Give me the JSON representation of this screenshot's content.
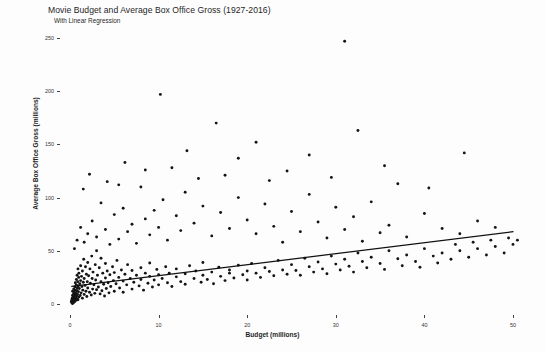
{
  "chart_data": {
    "type": "scatter",
    "title": "Movie Budget and Average Box Office Gross (1927-2016)",
    "subtitle": "With Linear Regression",
    "xlabel": "Budget (millions)",
    "ylabel": "Average Box Office Gross (millions)",
    "xlim": [
      -1.0,
      52.0
    ],
    "ylim": [
      -12.0,
      262.0
    ],
    "xticks": [
      0,
      10,
      20,
      30,
      40,
      50
    ],
    "xtick_labels": [
      "0",
      "10",
      "20",
      "30",
      "40",
      "50"
    ],
    "yticks": [
      0,
      50,
      100,
      150,
      200,
      250
    ],
    "ytick_labels": [
      "0",
      "50",
      "100",
      "150",
      "200",
      "250"
    ],
    "grid": false,
    "legend": "none",
    "marker_color": "#141414",
    "line_color": "#111111",
    "background_color": "#fdfdfd",
    "regression": {
      "name": "Linear Regression",
      "x_start": 0.2,
      "y_start": 16.5,
      "x_end": 50.0,
      "y_end": 68.0,
      "slope": 1.035,
      "intercept": 16.3
    },
    "points": [
      [
        0.15,
        2.0
      ],
      [
        0.2,
        3.5
      ],
      [
        0.22,
        1.0
      ],
      [
        0.25,
        5.5
      ],
      [
        0.28,
        8.0
      ],
      [
        0.3,
        0.5
      ],
      [
        0.3,
        12.0
      ],
      [
        0.32,
        4.0
      ],
      [
        0.35,
        2.5
      ],
      [
        0.38,
        6.5
      ],
      [
        0.4,
        9.5
      ],
      [
        0.4,
        1.5
      ],
      [
        0.42,
        14.0
      ],
      [
        0.45,
        3.0
      ],
      [
        0.48,
        7.0
      ],
      [
        0.5,
        11.0
      ],
      [
        0.5,
        5.0
      ],
      [
        0.52,
        2.0
      ],
      [
        0.55,
        16.0
      ],
      [
        0.58,
        8.5
      ],
      [
        0.6,
        4.5
      ],
      [
        0.6,
        20.0
      ],
      [
        0.62,
        13.0
      ],
      [
        0.65,
        6.0
      ],
      [
        0.68,
        10.0
      ],
      [
        0.7,
        3.5
      ],
      [
        0.7,
        18.0
      ],
      [
        0.72,
        23.0
      ],
      [
        0.75,
        7.5
      ],
      [
        0.78,
        12.5
      ],
      [
        0.8,
        5.0
      ],
      [
        0.8,
        27.0
      ],
      [
        0.82,
        15.0
      ],
      [
        0.85,
        9.0
      ],
      [
        0.88,
        21.0
      ],
      [
        0.9,
        4.0
      ],
      [
        0.9,
        33.0
      ],
      [
        0.92,
        17.0
      ],
      [
        0.95,
        11.5
      ],
      [
        0.98,
        25.0
      ],
      [
        1.0,
        6.5
      ],
      [
        1.0,
        29.0
      ],
      [
        1.05,
        14.5
      ],
      [
        1.1,
        19.0
      ],
      [
        1.15,
        8.0
      ],
      [
        1.2,
        36.0
      ],
      [
        1.2,
        22.0
      ],
      [
        1.25,
        10.5
      ],
      [
        1.3,
        26.0
      ],
      [
        1.35,
        16.5
      ],
      [
        1.4,
        5.5
      ],
      [
        1.4,
        31.0
      ],
      [
        1.45,
        13.0
      ],
      [
        1.5,
        20.5
      ],
      [
        1.55,
        42.0
      ],
      [
        1.6,
        9.0
      ],
      [
        1.6,
        24.0
      ],
      [
        1.7,
        17.5
      ],
      [
        1.75,
        35.0
      ],
      [
        1.8,
        12.0
      ],
      [
        1.85,
        28.0
      ],
      [
        1.9,
        7.0
      ],
      [
        1.95,
        21.0
      ],
      [
        2.0,
        39.0
      ],
      [
        2.0,
        15.0
      ],
      [
        2.1,
        26.5
      ],
      [
        2.2,
        11.0
      ],
      [
        2.25,
        33.0
      ],
      [
        2.3,
        19.5
      ],
      [
        2.4,
        8.5
      ],
      [
        2.45,
        45.0
      ],
      [
        2.5,
        24.0
      ],
      [
        2.55,
        14.0
      ],
      [
        2.6,
        30.0
      ],
      [
        2.7,
        18.0
      ],
      [
        2.8,
        10.0
      ],
      [
        2.85,
        37.0
      ],
      [
        2.9,
        22.5
      ],
      [
        3.0,
        13.5
      ],
      [
        3.0,
        50.0
      ],
      [
        3.1,
        27.0
      ],
      [
        3.2,
        16.0
      ],
      [
        3.3,
        34.0
      ],
      [
        3.4,
        9.5
      ],
      [
        3.5,
        21.0
      ],
      [
        3.5,
        43.0
      ],
      [
        3.6,
        12.5
      ],
      [
        3.7,
        29.0
      ],
      [
        3.8,
        18.5
      ],
      [
        3.9,
        7.5
      ],
      [
        4.0,
        24.5
      ],
      [
        4.0,
        38.0
      ],
      [
        4.1,
        14.5
      ],
      [
        4.2,
        31.0
      ],
      [
        4.3,
        20.0
      ],
      [
        4.4,
        10.5
      ],
      [
        4.5,
        27.5
      ],
      [
        4.6,
        16.5
      ],
      [
        4.8,
        35.0
      ],
      [
        4.9,
        22.0
      ],
      [
        5.0,
        12.0
      ],
      [
        5.0,
        29.5
      ],
      [
        5.2,
        19.0
      ],
      [
        5.3,
        41.0
      ],
      [
        5.5,
        25.0
      ],
      [
        5.6,
        15.0
      ],
      [
        5.8,
        32.0
      ],
      [
        6.0,
        21.5
      ],
      [
        6.0,
        11.0
      ],
      [
        6.2,
        28.0
      ],
      [
        6.4,
        18.0
      ],
      [
        6.5,
        37.0
      ],
      [
        6.8,
        24.0
      ],
      [
        7.0,
        14.0
      ],
      [
        7.0,
        31.5
      ],
      [
        7.2,
        20.5
      ],
      [
        7.5,
        27.0
      ],
      [
        7.8,
        17.0
      ],
      [
        8.0,
        34.0
      ],
      [
        8.0,
        23.0
      ],
      [
        8.3,
        13.0
      ],
      [
        8.5,
        29.0
      ],
      [
        8.8,
        19.5
      ],
      [
        9.0,
        26.0
      ],
      [
        9.0,
        38.5
      ],
      [
        9.3,
        16.0
      ],
      [
        9.5,
        22.5
      ],
      [
        9.8,
        32.5
      ],
      [
        10.0,
        18.0
      ],
      [
        10.0,
        27.5
      ],
      [
        10.4,
        24.0
      ],
      [
        10.8,
        35.0
      ],
      [
        11.0,
        20.0
      ],
      [
        11.2,
        29.0
      ],
      [
        11.5,
        16.5
      ],
      [
        12.0,
        25.5
      ],
      [
        12.0,
        33.0
      ],
      [
        12.5,
        21.0
      ],
      [
        13.0,
        28.5
      ],
      [
        13.0,
        18.5
      ],
      [
        13.5,
        36.0
      ],
      [
        14.0,
        24.0
      ],
      [
        14.2,
        31.0
      ],
      [
        14.8,
        20.5
      ],
      [
        15.0,
        27.0
      ],
      [
        15.0,
        39.0
      ],
      [
        15.5,
        23.0
      ],
      [
        16.0,
        30.0
      ],
      [
        16.2,
        19.0
      ],
      [
        16.8,
        34.5
      ],
      [
        17.0,
        26.0
      ],
      [
        17.5,
        22.0
      ],
      [
        18.0,
        32.0
      ],
      [
        18.0,
        29.0
      ],
      [
        18.5,
        24.5
      ],
      [
        19.0,
        36.5
      ],
      [
        19.5,
        27.5
      ],
      [
        20.0,
        31.0
      ],
      [
        20.0,
        22.5
      ],
      [
        20.5,
        38.0
      ],
      [
        21.0,
        29.0
      ],
      [
        21.5,
        25.0
      ],
      [
        22.0,
        34.0
      ],
      [
        22.5,
        30.5
      ],
      [
        23.0,
        26.5
      ],
      [
        23.5,
        41.0
      ],
      [
        24.0,
        32.0
      ],
      [
        24.5,
        28.0
      ],
      [
        25.0,
        37.0
      ],
      [
        25.5,
        31.5
      ],
      [
        26.0,
        27.0
      ],
      [
        26.5,
        43.0
      ],
      [
        27.0,
        35.0
      ],
      [
        27.5,
        30.0
      ],
      [
        28.0,
        39.5
      ],
      [
        28.5,
        33.0
      ],
      [
        29.0,
        28.5
      ],
      [
        29.5,
        45.0
      ],
      [
        30.0,
        37.5
      ],
      [
        30.5,
        32.0
      ],
      [
        31.0,
        42.0
      ],
      [
        31.5,
        35.5
      ],
      [
        32.0,
        30.0
      ],
      [
        32.5,
        48.0
      ],
      [
        33.0,
        40.0
      ],
      [
        33.5,
        34.0
      ],
      [
        34.0,
        44.0
      ],
      [
        35.0,
        38.0
      ],
      [
        35.5,
        32.5
      ],
      [
        36.0,
        50.0
      ],
      [
        37.0,
        42.5
      ],
      [
        37.5,
        36.0
      ],
      [
        38.0,
        46.0
      ],
      [
        39.0,
        40.0
      ],
      [
        39.5,
        34.5
      ],
      [
        40.0,
        52.0
      ],
      [
        41.0,
        45.0
      ],
      [
        41.5,
        38.5
      ],
      [
        42.0,
        48.0
      ],
      [
        43.0,
        42.0
      ],
      [
        43.5,
        56.0
      ],
      [
        44.0,
        50.0
      ],
      [
        45.0,
        44.0
      ],
      [
        45.5,
        58.0
      ],
      [
        46.0,
        52.0
      ],
      [
        47.0,
        46.0
      ],
      [
        47.5,
        60.0
      ],
      [
        48.0,
        54.0
      ],
      [
        49.0,
        48.0
      ],
      [
        49.5,
        62.0
      ],
      [
        50.0,
        56.0
      ],
      [
        0.5,
        52.0
      ],
      [
        0.8,
        60.0
      ],
      [
        1.2,
        72.0
      ],
      [
        1.6,
        58.0
      ],
      [
        2.0,
        66.0
      ],
      [
        2.5,
        78.0
      ],
      [
        3.0,
        63.0
      ],
      [
        3.5,
        95.0
      ],
      [
        4.0,
        70.0
      ],
      [
        4.5,
        56.0
      ],
      [
        5.0,
        84.0
      ],
      [
        5.5,
        61.0
      ],
      [
        6.0,
        90.0
      ],
      [
        6.5,
        68.0
      ],
      [
        7.0,
        75.0
      ],
      [
        7.5,
        57.0
      ],
      [
        8.0,
        110.0
      ],
      [
        8.5,
        80.0
      ],
      [
        9.0,
        65.0
      ],
      [
        9.5,
        88.0
      ],
      [
        10.0,
        72.0
      ],
      [
        10.5,
        98.0
      ],
      [
        11.0,
        60.0
      ],
      [
        12.0,
        83.0
      ],
      [
        12.5,
        69.0
      ],
      [
        13.0,
        105.0
      ],
      [
        14.0,
        76.0
      ],
      [
        15.0,
        92.0
      ],
      [
        16.0,
        64.0
      ],
      [
        17.0,
        86.0
      ],
      [
        18.0,
        71.0
      ],
      [
        19.0,
        100.0
      ],
      [
        20.0,
        79.0
      ],
      [
        21.0,
        66.0
      ],
      [
        22.0,
        94.0
      ],
      [
        23.0,
        73.0
      ],
      [
        24.0,
        58.0
      ],
      [
        25.0,
        87.0
      ],
      [
        26.0,
        68.0
      ],
      [
        27.0,
        103.0
      ],
      [
        28.0,
        77.0
      ],
      [
        29.0,
        62.0
      ],
      [
        30.0,
        91.0
      ],
      [
        31.0,
        70.0
      ],
      [
        32.0,
        82.0
      ],
      [
        33.0,
        59.0
      ],
      [
        34.0,
        96.0
      ],
      [
        35.0,
        67.0
      ],
      [
        36.0,
        74.0
      ],
      [
        38.0,
        63.0
      ],
      [
        40.0,
        85.0
      ],
      [
        42.0,
        71.0
      ],
      [
        44.0,
        66.0
      ],
      [
        46.0,
        78.0
      ],
      [
        48.0,
        72.0
      ],
      [
        50.5,
        60.0
      ],
      [
        2.2,
        122.0
      ],
      [
        4.2,
        115.0
      ],
      [
        6.2,
        133.0
      ],
      [
        10.2,
        197.0
      ],
      [
        11.5,
        128.0
      ],
      [
        13.2,
        144.0
      ],
      [
        14.5,
        118.0
      ],
      [
        16.5,
        170.0
      ],
      [
        19.0,
        137.0
      ],
      [
        21.0,
        152.0
      ],
      [
        24.5,
        125.0
      ],
      [
        27.0,
        140.0
      ],
      [
        31.0,
        247.0
      ],
      [
        32.5,
        163.0
      ],
      [
        35.5,
        130.0
      ],
      [
        44.5,
        142.0
      ],
      [
        1.5,
        108.0
      ],
      [
        5.5,
        112.0
      ],
      [
        8.5,
        126.0
      ],
      [
        17.5,
        121.0
      ],
      [
        22.5,
        116.0
      ],
      [
        29.5,
        119.0
      ],
      [
        37.0,
        113.0
      ],
      [
        40.5,
        109.0
      ]
    ]
  }
}
